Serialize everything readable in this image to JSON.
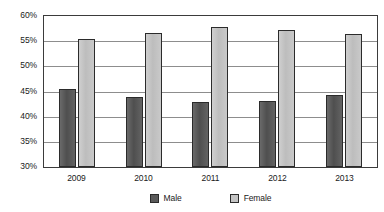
{
  "chart_data": {
    "type": "bar",
    "title": "",
    "subtitle": "",
    "xlabel": "",
    "ylabel": "",
    "categories": [
      "2009",
      "2010",
      "2011",
      "2012",
      "2013"
    ],
    "series": [
      {
        "name": "Male",
        "color": "#5a5a5a",
        "values": [
          45.5,
          44.0,
          43.0,
          43.2,
          44.4
        ]
      },
      {
        "name": "Female",
        "color": "#c4c4c4",
        "values": [
          55.4,
          56.7,
          57.8,
          57.3,
          56.5
        ]
      }
    ],
    "ylim": [
      30,
      60
    ],
    "ytick_step": 5,
    "ytick_labels": [
      "60%",
      "55%",
      "50%",
      "45%",
      "40%",
      "35%",
      "30%"
    ],
    "ytick_values": [
      60,
      55,
      50,
      45,
      40,
      35,
      30
    ],
    "value_suffix": "%",
    "grid": true,
    "grid_color": "#8d8d8d",
    "legend_position": "bottom",
    "frame_color": "#3b3b3b",
    "background": "#ffffff"
  }
}
